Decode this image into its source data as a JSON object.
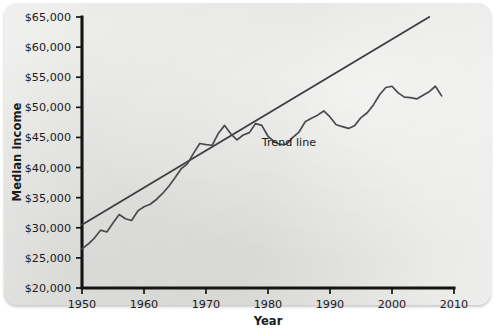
{
  "chart_data": {
    "type": "line",
    "title": "",
    "xlabel": "Year",
    "ylabel": "Median income",
    "xlim": [
      1950,
      2010
    ],
    "ylim": [
      20000,
      65000
    ],
    "xticks": [
      1950,
      1960,
      1970,
      1980,
      1990,
      2000,
      2010
    ],
    "xtick_labels": [
      "1950",
      "1960",
      "1970",
      "1980",
      "1990",
      "2000",
      "2010"
    ],
    "yticks": [
      20000,
      25000,
      30000,
      35000,
      40000,
      45000,
      50000,
      55000,
      60000,
      65000
    ],
    "ytick_labels": [
      "$20,000",
      "$25,000",
      "$30,000",
      "$35,000",
      "$40,000",
      "$45,000",
      "$50,000",
      "$55,000",
      "$60,000",
      "$65,000"
    ],
    "grid": false,
    "legend": "none",
    "annotations": [
      {
        "text": "Trend line",
        "x": 1979,
        "y": 43500
      }
    ],
    "series": [
      {
        "name": "Median income",
        "type": "line",
        "color": "#4a4a4c",
        "x": [
          1950,
          1951,
          1952,
          1953,
          1954,
          1955,
          1956,
          1957,
          1958,
          1959,
          1960,
          1961,
          1962,
          1963,
          1964,
          1965,
          1966,
          1967,
          1968,
          1969,
          1970,
          1971,
          1972,
          1973,
          1974,
          1975,
          1976,
          1977,
          1978,
          1979,
          1980,
          1981,
          1982,
          1983,
          1984,
          1985,
          1986,
          1987,
          1988,
          1989,
          1990,
          1991,
          1992,
          1993,
          1994,
          1995,
          1996,
          1997,
          1998,
          1999,
          2000,
          2001,
          2002,
          2003,
          2004,
          2005,
          2006,
          2007,
          2008
        ],
        "y": [
          26500,
          27300,
          28300,
          29600,
          29300,
          30800,
          32200,
          31500,
          31200,
          32800,
          33500,
          33900,
          34700,
          35700,
          36900,
          38300,
          39800,
          40600,
          42400,
          44000,
          43800,
          43700,
          45700,
          47000,
          45600,
          44600,
          45400,
          45800,
          47300,
          47000,
          45200,
          44300,
          43800,
          43900,
          45000,
          45900,
          47600,
          48200,
          48700,
          49400,
          48400,
          47100,
          46800,
          46500,
          47000,
          48300,
          49100,
          50400,
          52100,
          53300,
          53500,
          52400,
          51700,
          51600,
          51400,
          52000,
          52600,
          53500,
          51900
        ]
      },
      {
        "name": "Trend line",
        "type": "line",
        "color": "#3f3f41",
        "x": [
          1950,
          2006
        ],
        "y": [
          30500,
          65000
        ]
      }
    ]
  }
}
